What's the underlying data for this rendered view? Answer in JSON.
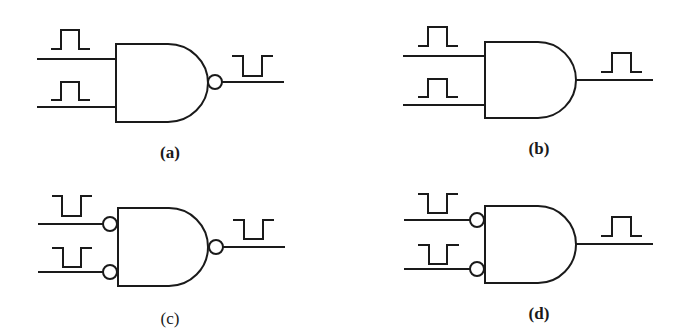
{
  "figure": {
    "panels": [
      {
        "id": "a",
        "label": "(a)",
        "label_bold": true,
        "gate_type": "NAND",
        "input_bubbles": false,
        "output_bubble": true,
        "input_pulses": [
          "positive-pulse",
          "positive-pulse"
        ],
        "output_pulse": "negative-pulse"
      },
      {
        "id": "b",
        "label": "(b)",
        "label_bold": true,
        "gate_type": "AND",
        "input_bubbles": false,
        "output_bubble": false,
        "input_pulses": [
          "positive-pulse",
          "positive-pulse"
        ],
        "output_pulse": "positive-pulse"
      },
      {
        "id": "c",
        "label": "(c)",
        "label_bold": false,
        "gate_type": "NAND with inverted inputs",
        "input_bubbles": true,
        "output_bubble": true,
        "input_pulses": [
          "negative-pulse",
          "negative-pulse"
        ],
        "output_pulse": "negative-pulse"
      },
      {
        "id": "d",
        "label": "(d)",
        "label_bold": true,
        "gate_type": "AND with inverted inputs",
        "input_bubbles": true,
        "output_bubble": false,
        "input_pulses": [
          "negative-pulse",
          "negative-pulse"
        ],
        "output_pulse": "positive-pulse"
      }
    ],
    "colors": {
      "line": "#1a1a1a",
      "background": "#ffffff"
    }
  }
}
